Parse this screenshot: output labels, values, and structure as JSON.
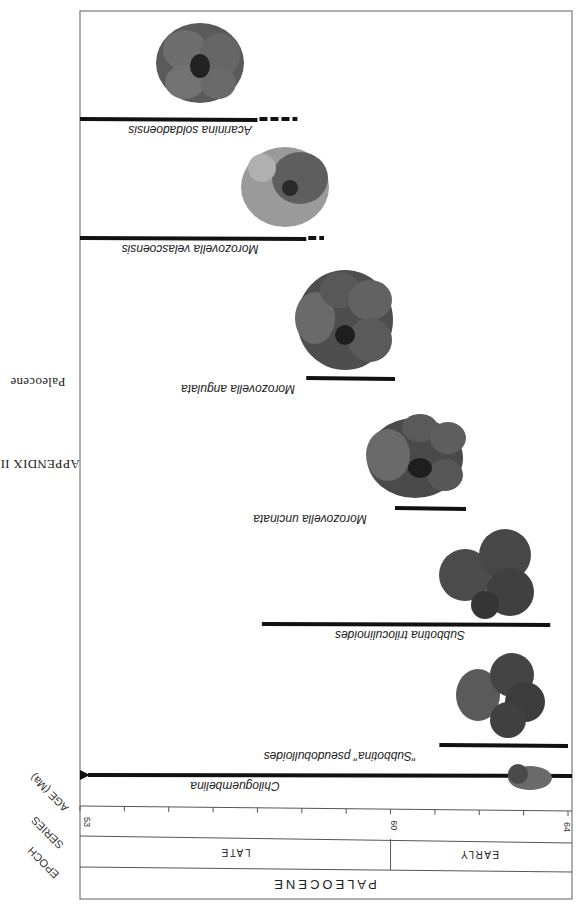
{
  "header": {
    "appendix": "APPENDIX III",
    "section": "Paleocene"
  },
  "chart_data": {
    "type": "range-chart",
    "orientation_note": "page printed rotated 180 degrees",
    "xlabel": "AGE (Ma)",
    "xlim": [
      53,
      64
    ],
    "ticks": [
      53,
      54,
      55,
      56,
      57,
      58,
      59,
      60,
      61,
      62,
      63,
      64
    ],
    "tick_labels": [
      {
        "value": 53,
        "label": "53"
      },
      {
        "value": 60,
        "label": "60"
      },
      {
        "value": 64,
        "label": "64"
      }
    ],
    "row_labels": {
      "age": "AGE (Ma)",
      "series": "SERIES",
      "epoch": "EPOCH"
    },
    "series_bands": [
      {
        "label": "LATE",
        "from": 53,
        "to": 60
      },
      {
        "label": "EARLY",
        "from": 60,
        "to": 64
      }
    ],
    "epoch_bands": [
      {
        "label": "PALEOCENE",
        "from": 53,
        "to": 64
      }
    ],
    "taxa": [
      {
        "name": "Acarinina  soldadoensis",
        "solid": [
          53,
          57.0
        ],
        "dashed": [
          57.0,
          57.9
        ]
      },
      {
        "name": "Morozovella  velascoensis",
        "solid": [
          53,
          58.1
        ],
        "dashed": [
          58.1,
          58.5
        ]
      },
      {
        "name": "Morozovella  angulata",
        "solid": [
          58.1,
          60.1
        ],
        "dashed": null
      },
      {
        "name": "Morozovella  uncinata",
        "solid": [
          60.1,
          61.7
        ],
        "dashed": null
      },
      {
        "name": "Subbotina  triloculinoides",
        "solid": [
          57.1,
          63.6
        ],
        "dashed": null
      },
      {
        "name": "\"Subbotina\" pseudobulloides",
        "solid": [
          61.1,
          64.0
        ],
        "dashed": null
      },
      {
        "name": "Chiloguembelina",
        "solid": [
          53,
          64.0
        ],
        "dashed": null,
        "extends_beyond": "younger (arrow at 53 Ma)"
      }
    ]
  }
}
